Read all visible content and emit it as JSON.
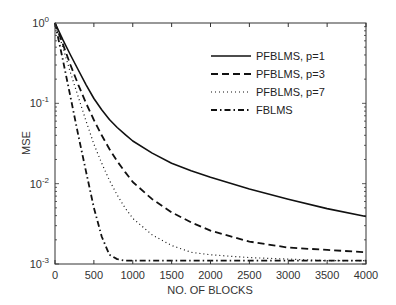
{
  "chart_data": {
    "type": "line",
    "title": "",
    "xlabel": "NO. OF BLOCKS",
    "ylabel": "MSE",
    "xlim": [
      0,
      4000
    ],
    "ylim": [
      0.001,
      1
    ],
    "yscale": "log",
    "grid": false,
    "legend_position": "upper right",
    "x_ticks": [
      0,
      500,
      1000,
      1500,
      2000,
      2500,
      3000,
      3500,
      4000
    ],
    "x_tick_labels": [
      "0",
      "500",
      "1000",
      "1500",
      "2000",
      "2500",
      "3000",
      "3500",
      "4000"
    ],
    "y_ticks": [
      0.001,
      0.01,
      0.1,
      1
    ],
    "y_tick_labels": [
      {
        "base": "10",
        "exp": "-3"
      },
      {
        "base": "10",
        "exp": "-2"
      },
      {
        "base": "10",
        "exp": "-1"
      },
      {
        "base": "10",
        "exp": "0"
      }
    ],
    "x": [
      0,
      100,
      200,
      300,
      400,
      500,
      600,
      700,
      800,
      900,
      1000,
      1250,
      1500,
      1750,
      2000,
      2500,
      3000,
      3500,
      4000
    ],
    "series": [
      {
        "name": "PFBLMS, p=1",
        "style": "solid",
        "values": [
          1.0,
          0.62,
          0.4,
          0.26,
          0.17,
          0.115,
          0.083,
          0.063,
          0.05,
          0.041,
          0.034,
          0.024,
          0.018,
          0.0145,
          0.012,
          0.0086,
          0.0064,
          0.0049,
          0.0039
        ]
      },
      {
        "name": "PFBLMS, p=3",
        "style": "dashed",
        "values": [
          1.0,
          0.55,
          0.3,
          0.17,
          0.1,
          0.062,
          0.04,
          0.027,
          0.019,
          0.014,
          0.0105,
          0.0064,
          0.0044,
          0.0033,
          0.0026,
          0.0019,
          0.0016,
          0.0015,
          0.0014
        ]
      },
      {
        "name": "PFBLMS, p=7",
        "style": "dotted",
        "values": [
          1.0,
          0.5,
          0.24,
          0.12,
          0.06,
          0.031,
          0.018,
          0.011,
          0.0072,
          0.005,
          0.0037,
          0.0023,
          0.0017,
          0.0014,
          0.0013,
          0.0012,
          0.00115,
          0.0011,
          0.0011
        ]
      },
      {
        "name": "FBLMS",
        "style": "dashdot",
        "values": [
          1.0,
          0.35,
          0.12,
          0.04,
          0.014,
          0.005,
          0.0022,
          0.0013,
          0.00115,
          0.0011,
          0.0011,
          0.0011,
          0.0011,
          0.0011,
          0.0011,
          0.0011,
          0.0011,
          0.0011,
          0.0011
        ]
      }
    ]
  },
  "colors": {
    "axis": "#333333",
    "line": "#111111",
    "background": "#ffffff"
  }
}
